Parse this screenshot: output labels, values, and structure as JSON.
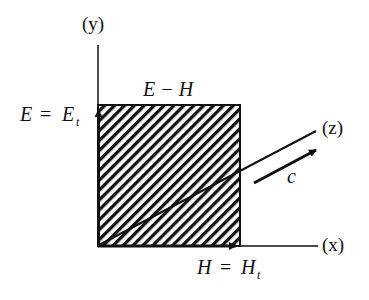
{
  "figure": {
    "type": "plane-wave-field-diagram",
    "colors": {
      "ink": "#111111",
      "background": "#ffffff"
    }
  },
  "axes": {
    "y": {
      "label": "(y)"
    },
    "x": {
      "label": "(x)"
    },
    "z": {
      "label": "(z)"
    }
  },
  "labels": {
    "plane": "E − H",
    "e_field_lhs": "E",
    "e_field_eq": "=",
    "e_field_rhs": "E",
    "e_field_sub": "t",
    "h_field_lhs": "H",
    "h_field_eq": "=",
    "h_field_rhs": "H",
    "h_field_sub": "t",
    "propagation": "c"
  }
}
